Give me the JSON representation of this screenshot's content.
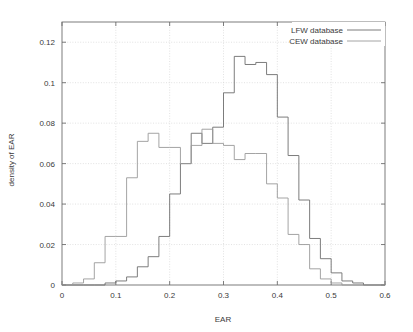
{
  "chart_data": {
    "type": "line",
    "title": "",
    "xlabel": "EAR",
    "ylabel": "density of EAR",
    "xlim": [
      0,
      0.6
    ],
    "ylim": [
      0,
      0.13
    ],
    "xticks": [
      "0",
      "0.1",
      "0.2",
      "0.3",
      "0.4",
      "0.5",
      "0.6"
    ],
    "xtick_values": [
      0,
      0.1,
      0.2,
      0.3,
      0.4,
      0.5,
      0.6
    ],
    "yticks": [
      "0",
      "0.02",
      "0.04",
      "0.06",
      "0.08",
      "0.1",
      "0.12"
    ],
    "ytick_values": [
      0,
      0.02,
      0.04,
      0.06,
      0.08,
      0.1,
      0.12
    ],
    "grid": true,
    "legend_position": "top-right",
    "bin_width": 0.02,
    "series": [
      {
        "name": "LFW database",
        "color": "#6e6e6e",
        "bin_start": 0.0,
        "values": [
          0,
          0,
          0,
          0,
          0.001,
          0.002,
          0.004,
          0.009,
          0.014,
          0.024,
          0.045,
          0.06,
          0.075,
          0.07,
          0.078,
          0.095,
          0.113,
          0.109,
          0.11,
          0.104,
          0.083,
          0.064,
          0.042,
          0.023,
          0.013,
          0.006,
          0.002,
          0.001,
          0,
          0
        ]
      },
      {
        "name": "CEW database",
        "color": "#9a9a9a",
        "bin_start": 0.0,
        "values": [
          0,
          0.001,
          0.003,
          0.011,
          0.024,
          0.024,
          0.053,
          0.071,
          0.075,
          0.068,
          0.068,
          0.06,
          0.069,
          0.077,
          0.07,
          0.069,
          0.062,
          0.065,
          0.065,
          0.05,
          0.043,
          0.025,
          0.02,
          0.008,
          0.003,
          0.001,
          0,
          0,
          0,
          0
        ]
      }
    ]
  },
  "legend": {
    "entries": [
      {
        "label": "LFW database"
      },
      {
        "label": "CEW database"
      }
    ]
  },
  "axes": {
    "x_title": "EAR",
    "y_title": "density of EAR"
  }
}
